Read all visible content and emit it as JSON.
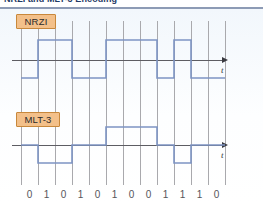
{
  "heading": {
    "title": "NRZI and MLT-3 Encoding"
  },
  "figure": {
    "signals": [
      {
        "name": "NRZI",
        "label_box": {
          "x": 16,
          "y": 5,
          "w": 40,
          "h": 15
        },
        "axis_y": 51,
        "high_y": 31,
        "low_y": 69,
        "axis_x_start": 12,
        "axis_x_end": 222,
        "axis_label": "t",
        "levels": [
          -1,
          1,
          1,
          -1,
          -1,
          1,
          1,
          1,
          -1,
          1,
          -1,
          -1
        ],
        "rule": "Transition at the start of every 1-bit; level held for 0-bits. Starts low."
      },
      {
        "name": "MLT-3",
        "label_box": {
          "x": 16,
          "y": 103,
          "w": 44,
          "h": 15
        },
        "axis_y": 136,
        "high_y": 118,
        "low_y": 154,
        "axis_x_start": 12,
        "axis_x_end": 222,
        "axis_label": "t",
        "levels": [
          0,
          -1,
          -1,
          0,
          0,
          1,
          1,
          1,
          0,
          -1,
          0,
          0
        ],
        "rule": "Cycles 0 -> -1 -> 0 -> +1 on every 1-bit; holds level on 0-bits."
      }
    ],
    "grid": {
      "x_start": 21,
      "spacing": 17,
      "count": 13,
      "y_top": 12,
      "y_bottom": 176,
      "color": "#a9a9ad"
    },
    "bit_sequence": [
      "0",
      "1",
      "0",
      "1",
      "0",
      "1",
      "0",
      "0",
      "1",
      "1",
      "1",
      "0"
    ],
    "bit_label_y": 180,
    "colors": {
      "wave_stroke": "#7d94c4",
      "grid": "#a9a9ad",
      "axis": "#5d5d63",
      "box_fill": "#f3c08a",
      "box_border": "#c8883c",
      "heading_rule": "#8d9bb5",
      "panel_tint": "#f2f7fc"
    }
  },
  "chart_data": {
    "type": "line",
    "title": "NRZI and MLT-3 Encoding",
    "xlabel": "t",
    "ylabel": "",
    "grid": true,
    "legend": "none",
    "x": [
      "0",
      "1",
      "0",
      "1",
      "0",
      "1",
      "0",
      "0",
      "1",
      "1",
      "1",
      "0"
    ],
    "series": [
      {
        "name": "NRZI",
        "values": [
          -1,
          1,
          1,
          -1,
          -1,
          1,
          1,
          1,
          -1,
          1,
          -1,
          -1
        ],
        "ylim": [
          -1,
          1
        ]
      },
      {
        "name": "MLT-3",
        "values": [
          0,
          -1,
          -1,
          0,
          0,
          1,
          1,
          1,
          0,
          -1,
          0,
          0
        ],
        "ylim": [
          -1,
          1
        ]
      }
    ]
  }
}
